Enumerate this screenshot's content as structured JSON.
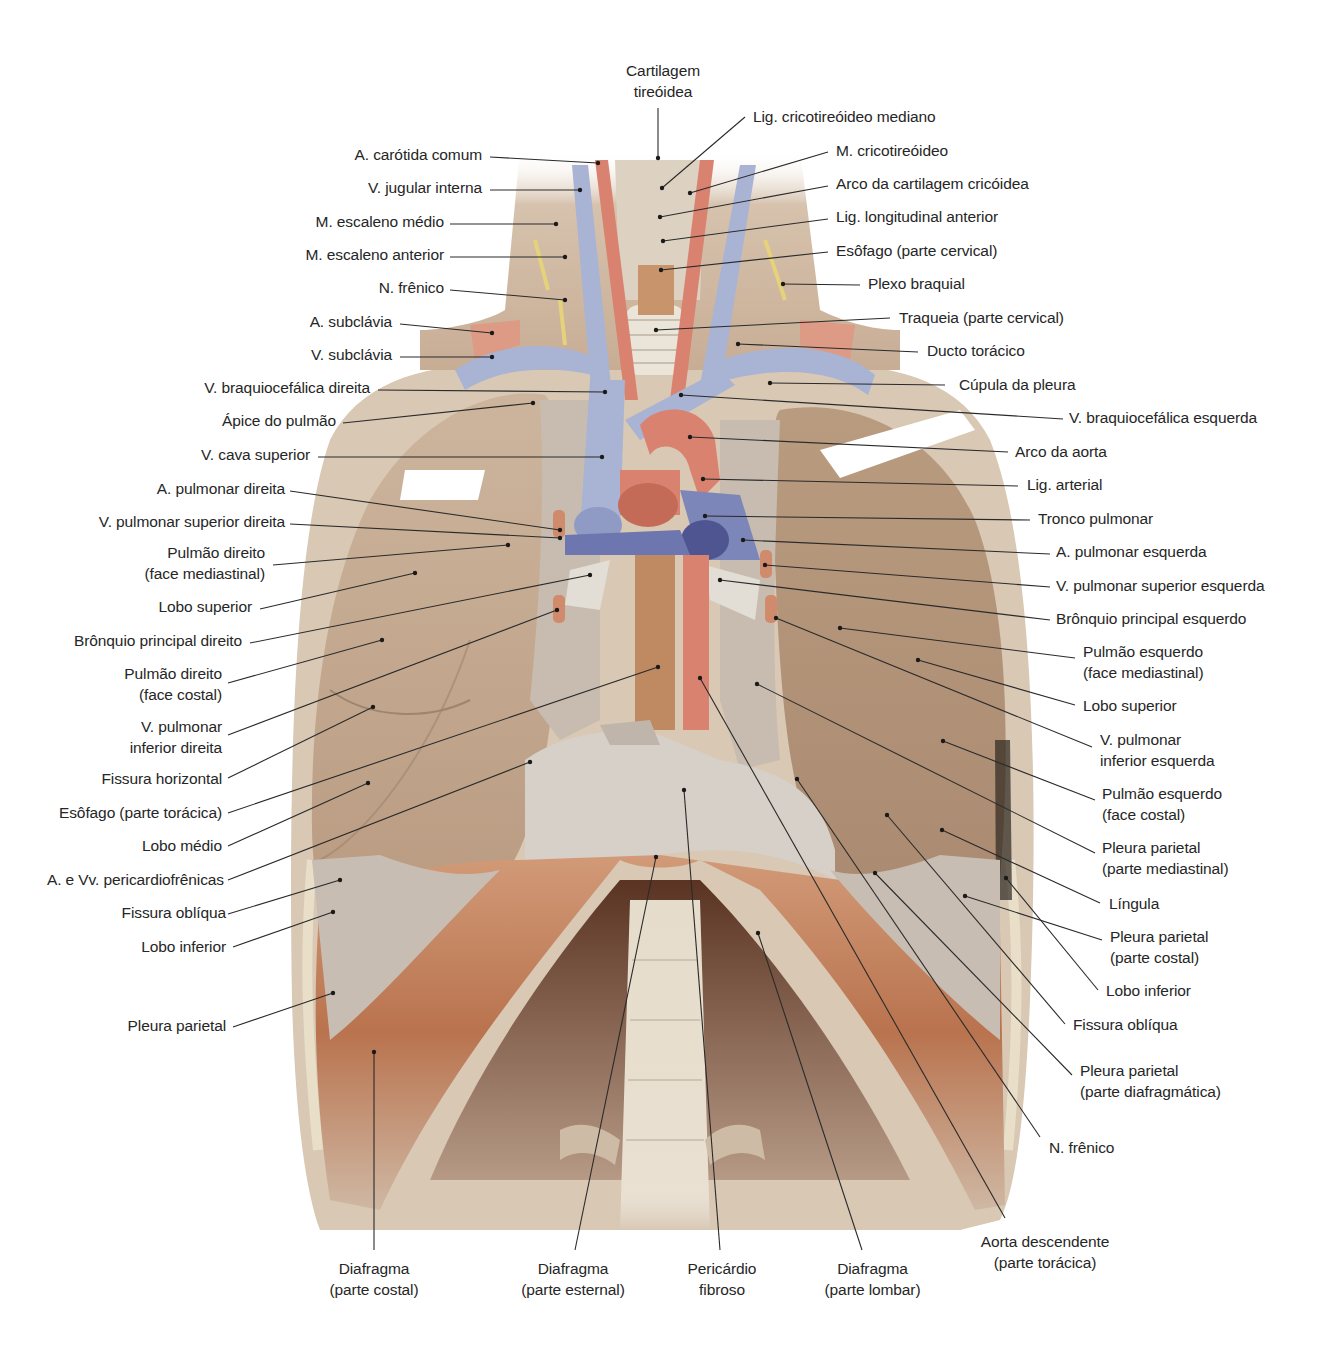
{
  "diagram": {
    "colors": {
      "background": "#ffffff",
      "label_text": "#262626",
      "leader_line": "#2a2a2a",
      "vein_blue": "#a9b3d3",
      "artery_red": "#d9826f",
      "lung_tan": "#c9ad92",
      "pleura_gray": "#c8bdb2",
      "muscle_brown": "#c27a55",
      "nerve_yellow": "#e6d27a"
    }
  },
  "labels": {
    "top": [
      {
        "id": "cartilagem-tireoidea",
        "lines": [
          "Cartilagem",
          "tireóidea"
        ]
      }
    ],
    "left": [
      {
        "id": "a-carotida-comum",
        "lines": [
          "A. carótida comum"
        ]
      },
      {
        "id": "v-jugular-interna",
        "lines": [
          "V. jugular interna"
        ]
      },
      {
        "id": "m-escaleno-medio",
        "lines": [
          "M. escaleno médio"
        ]
      },
      {
        "id": "m-escaleno-anterior",
        "lines": [
          "M. escaleno anterior"
        ]
      },
      {
        "id": "n-frenico-left",
        "lines": [
          "N. frênico"
        ]
      },
      {
        "id": "a-subclavia",
        "lines": [
          "A. subclávia"
        ]
      },
      {
        "id": "v-subclavia",
        "lines": [
          "V. subclávia"
        ]
      },
      {
        "id": "v-braquiocefalica-direita",
        "lines": [
          "V. braquiocefálica direita"
        ]
      },
      {
        "id": "apice-do-pulmao",
        "lines": [
          "Ápice do pulmão"
        ]
      },
      {
        "id": "v-cava-superior",
        "lines": [
          "V. cava superior"
        ]
      },
      {
        "id": "a-pulmonar-direita",
        "lines": [
          "A. pulmonar direita"
        ]
      },
      {
        "id": "v-pulmonar-superior-direita",
        "lines": [
          "V. pulmonar superior direita"
        ]
      },
      {
        "id": "pulmao-direito-face-mediastinal",
        "lines": [
          "Pulmão direito",
          "(face mediastinal)"
        ]
      },
      {
        "id": "lobo-superior-direito",
        "lines": [
          "Lobo superior"
        ]
      },
      {
        "id": "bronquio-principal-direito",
        "lines": [
          "Brônquio principal direito"
        ]
      },
      {
        "id": "pulmao-direito-face-costal",
        "lines": [
          "Pulmão direito",
          "(face costal)"
        ]
      },
      {
        "id": "v-pulmonar-inferior-direita",
        "lines": [
          "V. pulmonar",
          "inferior direita"
        ]
      },
      {
        "id": "fissura-horizontal",
        "lines": [
          "Fissura horizontal"
        ]
      },
      {
        "id": "esofago-parte-toracica",
        "lines": [
          "Esôfago (parte torácica)"
        ]
      },
      {
        "id": "lobo-medio",
        "lines": [
          "Lobo médio"
        ]
      },
      {
        "id": "a-e-vv-pericardiofrenicas",
        "lines": [
          "A. e Vv. pericardiofrênicas"
        ]
      },
      {
        "id": "fissura-obliqua-direita",
        "lines": [
          "Fissura oblíqua"
        ]
      },
      {
        "id": "lobo-inferior-direito",
        "lines": [
          "Lobo inferior"
        ]
      },
      {
        "id": "pleura-parietal-direita",
        "lines": [
          "Pleura parietal"
        ]
      }
    ],
    "right": [
      {
        "id": "lig-cricotireoideo-mediano",
        "lines": [
          "Lig. cricotireóideo mediano"
        ]
      },
      {
        "id": "m-cricotireoideo",
        "lines": [
          "M. cricotireóideo"
        ]
      },
      {
        "id": "arco-cartilagem-cricoidea",
        "lines": [
          "Arco da cartilagem cricóidea"
        ]
      },
      {
        "id": "lig-longitudinal-anterior",
        "lines": [
          "Lig. longitudinal anterior"
        ]
      },
      {
        "id": "esofago-parte-cervical",
        "lines": [
          "Esôfago (parte cervical)"
        ]
      },
      {
        "id": "plexo-braquial",
        "lines": [
          "Plexo braquial"
        ]
      },
      {
        "id": "traqueia-parte-cervical",
        "lines": [
          "Traqueia (parte cervical)"
        ]
      },
      {
        "id": "ducto-toracico",
        "lines": [
          "Ducto torácico"
        ]
      },
      {
        "id": "cupula-da-pleura",
        "lines": [
          "Cúpula da pleura"
        ]
      },
      {
        "id": "v-braquiocefalica-esquerda",
        "lines": [
          "V. braquiocefálica esquerda"
        ]
      },
      {
        "id": "arco-da-aorta",
        "lines": [
          "Arco da aorta"
        ]
      },
      {
        "id": "lig-arterial",
        "lines": [
          "Lig. arterial"
        ]
      },
      {
        "id": "tronco-pulmonar",
        "lines": [
          "Tronco pulmonar"
        ]
      },
      {
        "id": "a-pulmonar-esquerda",
        "lines": [
          "A. pulmonar esquerda"
        ]
      },
      {
        "id": "v-pulmonar-superior-esquerda",
        "lines": [
          "V. pulmonar superior esquerda"
        ]
      },
      {
        "id": "bronquio-principal-esquerdo",
        "lines": [
          "Brônquio principal esquerdo"
        ]
      },
      {
        "id": "pulmao-esquerdo-face-mediastinal",
        "lines": [
          "Pulmão esquerdo",
          "(face mediastinal)"
        ]
      },
      {
        "id": "lobo-superior-esquerdo",
        "lines": [
          "Lobo superior"
        ]
      },
      {
        "id": "v-pulmonar-inferior-esquerda",
        "lines": [
          "V. pulmonar",
          "inferior esquerda"
        ]
      },
      {
        "id": "pulmao-esquerdo-face-costal",
        "lines": [
          "Pulmão esquerdo",
          "(face costal)"
        ]
      },
      {
        "id": "pleura-parietal-mediastinal",
        "lines": [
          "Pleura parietal",
          "(parte mediastinal)"
        ]
      },
      {
        "id": "lingula",
        "lines": [
          "Língula"
        ]
      },
      {
        "id": "pleura-parietal-costal",
        "lines": [
          "Pleura parietal",
          "(parte costal)"
        ]
      },
      {
        "id": "lobo-inferior-esquerdo",
        "lines": [
          "Lobo inferior"
        ]
      },
      {
        "id": "fissura-obliqua-esquerda",
        "lines": [
          "Fissura oblíqua"
        ]
      },
      {
        "id": "pleura-parietal-diafragmatica",
        "lines": [
          "Pleura parietal",
          "(parte diafragmática)"
        ]
      },
      {
        "id": "n-frenico-right",
        "lines": [
          "N. frênico"
        ]
      }
    ],
    "bottom": [
      {
        "id": "diafragma-parte-costal",
        "lines": [
          "Diafragma",
          "(parte costal)"
        ]
      },
      {
        "id": "diafragma-parte-esternal",
        "lines": [
          "Diafragma",
          "(parte esternal)"
        ]
      },
      {
        "id": "pericardio-fibroso",
        "lines": [
          "Pericárdio",
          "fibroso"
        ]
      },
      {
        "id": "diafragma-parte-lombar",
        "lines": [
          "Diafragma",
          "(parte lombar)"
        ]
      },
      {
        "id": "aorta-descendente-parte-toracica",
        "lines": [
          "Aorta descendente",
          "(parte torácica)"
        ]
      }
    ]
  }
}
